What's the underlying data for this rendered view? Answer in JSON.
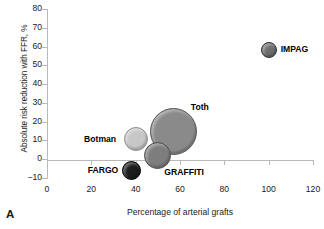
{
  "panel": {
    "letter": "A"
  },
  "chart_data": {
    "type": "scatter",
    "title": "",
    "xlabel": "Percentage of arterial grafts",
    "ylabel": "Absolute risk reduction with FFR, %",
    "xlim": [
      0,
      120
    ],
    "ylim": [
      -10,
      80
    ],
    "xticks": [
      0,
      20,
      40,
      60,
      80,
      100,
      120
    ],
    "yticks": [
      -10,
      0,
      10,
      20,
      30,
      40,
      50,
      60,
      70,
      80
    ],
    "grid": false,
    "legend": "none",
    "bubble_size_encodes": "study weight",
    "points": [
      {
        "name": "IMPAG",
        "x": 100,
        "y": 58,
        "size": 16,
        "color": "#6e6e6e",
        "edge": "#2d2d2d",
        "label_pos": "right",
        "bold": true
      },
      {
        "name": "Toth",
        "x": 57,
        "y": 15,
        "size": 47,
        "color": "#8a8a8a",
        "edge": "#5a5a5a",
        "label_pos": "upper-right",
        "bold": true
      },
      {
        "name": "Botman",
        "x": 40,
        "y": 11,
        "size": 24,
        "color": "#c7c7c7",
        "edge": "#8f8f8f",
        "label_pos": "left",
        "bold": true
      },
      {
        "name": "GRAFFITI",
        "x": 50,
        "y": 2,
        "size": 27,
        "color": "#7d7d7d",
        "edge": "#4f4f4f",
        "label_pos": "lower-right",
        "bold": true
      },
      {
        "name": "FARGO",
        "x": 38,
        "y": -6,
        "size": 19,
        "color": "#1c1c1c",
        "edge": "#000000",
        "label_pos": "left",
        "bold": true
      }
    ]
  },
  "axis_style": {
    "line_color": "#b9b9b9",
    "tick_color": "#b9b9b9",
    "text_color": "#1a1a1a"
  }
}
